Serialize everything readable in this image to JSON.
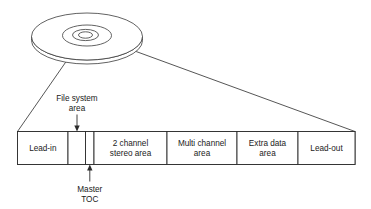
{
  "figure": {
    "type": "technical-diagram",
    "background_color": "#ffffff",
    "line_color": "#2b2b2b"
  },
  "disc": {
    "name": "optical-disc",
    "description": "Isometric view of a disc with center hole, hub ring and outer rim"
  },
  "track_bar": {
    "name": "disc-layout-bar",
    "segments": [
      {
        "id": "lead-in",
        "label_line1": "Lead-in",
        "label_line2": ""
      },
      {
        "id": "file-system",
        "label_line1": "",
        "label_line2": ""
      },
      {
        "id": "master-toc",
        "label_line1": "",
        "label_line2": ""
      },
      {
        "id": "two-channel",
        "label_line1": "2 channel",
        "label_line2": "stereo area"
      },
      {
        "id": "multi-channel",
        "label_line1": "Multi channel",
        "label_line2": "area"
      },
      {
        "id": "extra-data",
        "label_line1": "Extra data",
        "label_line2": "area"
      },
      {
        "id": "lead-out",
        "label_line1": "Lead-out",
        "label_line2": ""
      }
    ]
  },
  "callouts": [
    {
      "id": "file-system-area",
      "line1": "File system",
      "line2": "area",
      "position": "above"
    },
    {
      "id": "master-toc",
      "line1": "Master",
      "line2": "TOC",
      "position": "below"
    }
  ]
}
